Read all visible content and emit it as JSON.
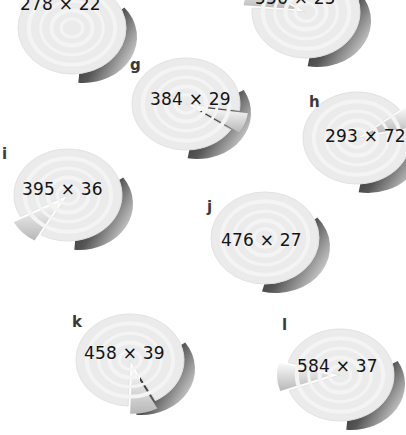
{
  "figure": {
    "kind": "pie-chart-grid",
    "background": "#ffffff",
    "palette": {
      "pie_fill": "#ebebeb",
      "pie_ring": "#f4f4f4",
      "pie_edge": "#e2e2e2",
      "shadow_dark": "#1a1a1a",
      "shadow_mid": "#9a9a9a",
      "exploded_slice": "#b8b8b8",
      "exploded_slice_light": "#fbfbfb",
      "label_color": "#3a3a3a",
      "caption_color": "#141414"
    }
  },
  "chart_data": {
    "type": "pie",
    "title": "",
    "xlabel": "",
    "ylabel": "",
    "legend_position": "none",
    "grid": false,
    "note": "Twelve-position grid of exploded 3D pie charts; each chart is annotated with its pixel dimensions as 'width x height'. Panels f and the top-centre panel are clipped by the top edge of the image.",
    "charts": [
      {
        "id": "f",
        "label": "",
        "caption": "278 × 22",
        "width": 278,
        "height": 22,
        "values": [
          62,
          20,
          18
        ],
        "exploded_index": 1,
        "clipped": true,
        "cx": 72,
        "cy": 28,
        "rx": 54,
        "ry": 46,
        "label_x": -40,
        "label_y": -40,
        "caption_x": 20,
        "caption_y": -4,
        "notch_start": 345,
        "notch_end": 345,
        "has_notch": false,
        "shadow_start": 320,
        "shadow_end": 95
      },
      {
        "id": "top-centre",
        "label": "",
        "caption": "556 × 25",
        "width": 556,
        "height": 25,
        "values": [
          58,
          24,
          18
        ],
        "exploded_index": 1,
        "clipped": true,
        "cx": 306,
        "cy": 12,
        "rx": 54,
        "ry": 46,
        "label_x": -40,
        "label_y": -40,
        "caption_x": 255,
        "caption_y": -10,
        "notch_start": 185,
        "notch_end": 215,
        "has_notch": true,
        "shadow_start": 330,
        "shadow_end": 100
      },
      {
        "id": "g",
        "label": "g",
        "caption": "384 × 29",
        "width": 384,
        "height": 29,
        "values": [
          64,
          22,
          14
        ],
        "exploded_index": 1,
        "clipped": false,
        "cx": 186,
        "cy": 104,
        "rx": 54,
        "ry": 46,
        "label_x": 130,
        "label_y": 58,
        "caption_x": 150,
        "caption_y": 91,
        "notch_start": 8,
        "notch_end": 34,
        "has_notch": true,
        "shadow_start": 330,
        "shadow_end": 100
      },
      {
        "id": "h",
        "label": "h",
        "caption": "293 × 72",
        "width": 293,
        "height": 72,
        "values": [
          66,
          20,
          14
        ],
        "exploded_index": 1,
        "clipped": true,
        "cx": 357,
        "cy": 138,
        "rx": 54,
        "ry": 46,
        "label_x": 309,
        "label_y": 95,
        "caption_x": 325,
        "caption_y": 128,
        "notch_start": 322,
        "notch_end": 350,
        "has_notch": true,
        "shadow_start": 335,
        "shadow_end": 100
      },
      {
        "id": "i",
        "label": "i",
        "caption": "395 × 36",
        "width": 395,
        "height": 36,
        "values": [
          70,
          18,
          12
        ],
        "exploded_index": 1,
        "clipped": false,
        "cx": 68,
        "cy": 195,
        "rx": 54,
        "ry": 46,
        "label_x": 2,
        "label_y": 147,
        "caption_x": 22,
        "caption_y": 181,
        "notch_start": 120,
        "notch_end": 152,
        "has_notch": true,
        "shadow_start": 325,
        "shadow_end": 95
      },
      {
        "id": "j",
        "label": "j",
        "caption": "476 × 27",
        "width": 476,
        "height": 27,
        "values": [
          68,
          20,
          12
        ],
        "exploded_index": 1,
        "clipped": false,
        "cx": 265,
        "cy": 238,
        "rx": 54,
        "ry": 46,
        "label_x": 207,
        "label_y": 200,
        "caption_x": 221,
        "caption_y": 232,
        "notch_start": 352,
        "notch_end": 356,
        "has_notch": false,
        "shadow_start": 320,
        "shadow_end": 105
      },
      {
        "id": "k",
        "label": "k",
        "caption": "458 × 39",
        "width": 458,
        "height": 39,
        "values": [
          72,
          16,
          12
        ],
        "exploded_index": 1,
        "clipped": false,
        "cx": 130,
        "cy": 360,
        "rx": 54,
        "ry": 46,
        "label_x": 72,
        "label_y": 315,
        "caption_x": 84,
        "caption_y": 345,
        "notch_start": 62,
        "notch_end": 92,
        "has_notch": true,
        "shadow_start": 325,
        "shadow_end": 95
      },
      {
        "id": "l",
        "label": "l",
        "caption": "584 × 37",
        "width": 584,
        "height": 37,
        "values": [
          74,
          14,
          12
        ],
        "exploded_index": 1,
        "clipped": true,
        "cx": 340,
        "cy": 375,
        "rx": 54,
        "ry": 46,
        "label_x": 282,
        "label_y": 318,
        "caption_x": 297,
        "caption_y": 358,
        "notch_start": 160,
        "notch_end": 196,
        "has_notch": true,
        "shadow_start": 330,
        "shadow_end": 95
      }
    ]
  }
}
